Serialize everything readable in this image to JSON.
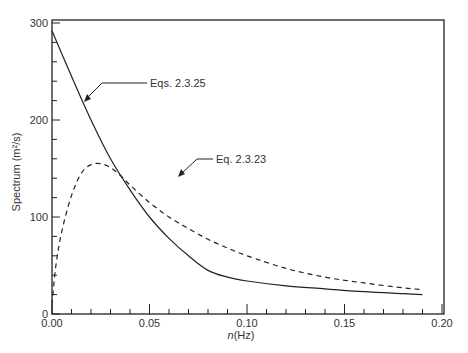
{
  "chart_data": {
    "type": "line",
    "title": "",
    "xlabel": "n(Hz)",
    "ylabel": "Spectrum (m²/s)",
    "xlim": [
      0,
      0.2
    ],
    "ylim": [
      0,
      300
    ],
    "grid": false,
    "x_ticks": [
      "0.00",
      "0.05",
      "0.10",
      "0.15",
      "0.20"
    ],
    "y_ticks": [
      "0",
      "100",
      "200",
      "300"
    ],
    "series": [
      {
        "name": "Eqs. 2.3.25",
        "style": "solid",
        "x": [
          0.0,
          0.01,
          0.02,
          0.03,
          0.04,
          0.05,
          0.06,
          0.07,
          0.08,
          0.09,
          0.1,
          0.12,
          0.14,
          0.16,
          0.18,
          0.19
        ],
        "values": [
          292,
          245,
          200,
          160,
          128,
          100,
          78,
          60,
          45,
          38,
          34,
          29,
          26,
          23,
          21,
          20
        ]
      },
      {
        "name": "Eq. 2.3.23",
        "style": "dashed",
        "x": [
          0.0,
          0.002,
          0.005,
          0.01,
          0.015,
          0.02,
          0.025,
          0.03,
          0.035,
          0.04,
          0.05,
          0.06,
          0.07,
          0.08,
          0.09,
          0.1,
          0.12,
          0.14,
          0.16,
          0.18,
          0.19
        ],
        "values": [
          10,
          50,
          85,
          122,
          145,
          154,
          155,
          151,
          143,
          133,
          115,
          100,
          88,
          77,
          68,
          60,
          47,
          38,
          32,
          27,
          25
        ]
      }
    ],
    "annotations": [
      {
        "text": "Eqs. 2.3.25",
        "points_to": "solid curve near n≈0.018"
      },
      {
        "text": "Eq. 2.3.23",
        "points_to": "dashed curve near n≈0.046"
      }
    ]
  }
}
